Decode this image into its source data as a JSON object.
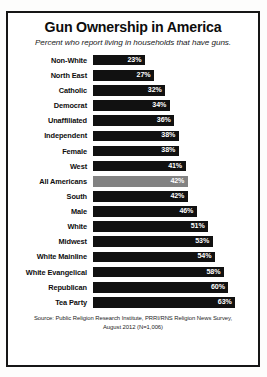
{
  "chart_data": {
    "type": "bar",
    "orientation": "horizontal",
    "title": "Gun Ownership in America",
    "subtitle": "Percent who report living in households that have guns.",
    "xlabel": "",
    "ylabel": "",
    "xlim": [
      0,
      70
    ],
    "grid": false,
    "legend": "none",
    "value_suffix": "%",
    "highlight_category": "All Americans",
    "colors": {
      "bar": "#111111",
      "bar_highlight": "#828282",
      "value_text": "#ffffff",
      "frame": "#161616",
      "background": "#ffffff"
    },
    "categories": [
      "Non-White",
      "North East",
      "Catholic",
      "Democrat",
      "Unaffiliated",
      "Independent",
      "Female",
      "West",
      "All Americans",
      "South",
      "Male",
      "White",
      "Midwest",
      "White Mainline",
      "White Evangelical",
      "Republican",
      "Tea Party"
    ],
    "values": [
      23,
      27,
      32,
      34,
      36,
      38,
      38,
      41,
      42,
      42,
      46,
      51,
      53,
      54,
      58,
      60,
      63
    ],
    "value_labels": [
      "23%",
      "27%",
      "32%",
      "34%",
      "36%",
      "38%",
      "38%",
      "41%",
      "42%",
      "42%",
      "46%",
      "51%",
      "53%",
      "54%",
      "58%",
      "60%",
      "63%"
    ]
  },
  "bars": [
    {
      "label": "Non-White",
      "value": 23,
      "value_label": "23%",
      "highlight": false
    },
    {
      "label": "North East",
      "value": 27,
      "value_label": "27%",
      "highlight": false
    },
    {
      "label": "Catholic",
      "value": 32,
      "value_label": "32%",
      "highlight": false
    },
    {
      "label": "Democrat",
      "value": 34,
      "value_label": "34%",
      "highlight": false
    },
    {
      "label": "Unaffiliated",
      "value": 36,
      "value_label": "36%",
      "highlight": false
    },
    {
      "label": "Independent",
      "value": 38,
      "value_label": "38%",
      "highlight": false
    },
    {
      "label": "Female",
      "value": 38,
      "value_label": "38%",
      "highlight": false
    },
    {
      "label": "West",
      "value": 41,
      "value_label": "41%",
      "highlight": false
    },
    {
      "label": "All Americans",
      "value": 42,
      "value_label": "42%",
      "highlight": true
    },
    {
      "label": "South",
      "value": 42,
      "value_label": "42%",
      "highlight": false
    },
    {
      "label": "Male",
      "value": 46,
      "value_label": "46%",
      "highlight": false
    },
    {
      "label": "White",
      "value": 51,
      "value_label": "51%",
      "highlight": false
    },
    {
      "label": "Midwest",
      "value": 53,
      "value_label": "53%",
      "highlight": false
    },
    {
      "label": "White Mainline",
      "value": 54,
      "value_label": "54%",
      "highlight": false
    },
    {
      "label": "White Evangelical",
      "value": 58,
      "value_label": "58%",
      "highlight": false
    },
    {
      "label": "Republican",
      "value": 60,
      "value_label": "60%",
      "highlight": false
    },
    {
      "label": "Tea Party",
      "value": 63,
      "value_label": "63%",
      "highlight": false
    }
  ],
  "source": {
    "line1": "Source: Public Religion Research Institute, PRRI/RNS Religion News Survey,",
    "line2": "August 2012 (N=1,006)"
  }
}
